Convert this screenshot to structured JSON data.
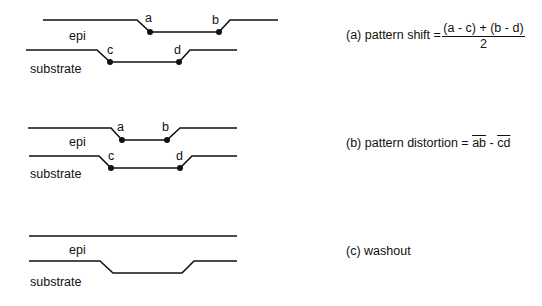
{
  "panels": [
    {
      "id": "a",
      "layer_labels": {
        "top": "epi",
        "bottom": "substrate"
      },
      "points": [
        "a",
        "b",
        "c",
        "d"
      ],
      "caption": {
        "prefix": "(a) pattern shift =",
        "numerator": "(a - c) + (b - d)",
        "denominator": "2"
      }
    },
    {
      "id": "b",
      "layer_labels": {
        "top": "epi",
        "bottom": "substrate"
      },
      "points": [
        "a",
        "b",
        "c",
        "d"
      ],
      "caption": {
        "prefix": "(b) pattern distortion =",
        "term1": "ab",
        "minus": " - ",
        "term2": "cd"
      }
    },
    {
      "id": "c",
      "layer_labels": {
        "top": "epi",
        "bottom": "substrate"
      },
      "caption": {
        "text": "(c) washout"
      }
    }
  ]
}
